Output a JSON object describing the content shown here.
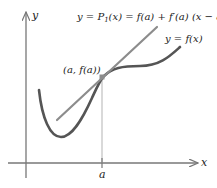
{
  "diagram": {
    "axes": {
      "x_label": "x",
      "y_label": "y",
      "x_tick_label": "a",
      "color": "#777777"
    },
    "labels": {
      "tangent_prefix": "y = P",
      "tangent_sub": "1",
      "tangent_suffix": "(x) = f(a) + f′(a) (x − a)",
      "curve": "y = f(x)",
      "point": "(a, f(a))"
    },
    "colors": {
      "curve": "#555555",
      "tangent": "#8c8c8c",
      "point": "#8c8c8c",
      "guide": "#aaaaaa",
      "text": "#222222"
    }
  }
}
